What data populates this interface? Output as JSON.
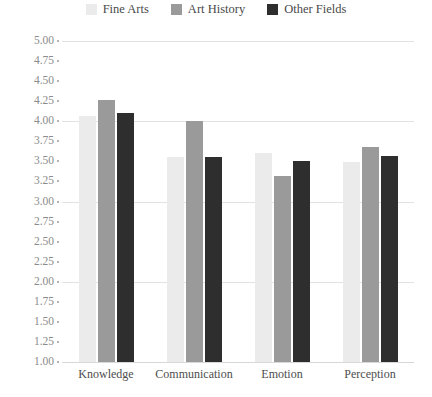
{
  "chart_data": {
    "type": "bar",
    "title": "",
    "subtitle": "",
    "xlabel": "",
    "ylabel": "",
    "categories": [
      "Knowledge",
      "Communication",
      "Emotion",
      "Perception"
    ],
    "series": [
      {
        "name": "Fine Arts",
        "color": "#ebebeb",
        "values": [
          4.07,
          3.56,
          3.6,
          3.49
        ]
      },
      {
        "name": "Art History",
        "color": "#9a9a9a",
        "values": [
          4.27,
          4.0,
          3.32,
          3.68
        ]
      },
      {
        "name": "Other Fields",
        "color": "#2e2e2e",
        "values": [
          4.1,
          3.56,
          3.5,
          3.57
        ]
      }
    ],
    "ylim": [
      1.0,
      5.0
    ],
    "ytick_step": 0.25,
    "ytick_labels": [
      "5.00",
      "4.75",
      "4.50",
      "4.25",
      "4.00",
      "3.75",
      "3.50",
      "3.25",
      "3.00",
      "2.75",
      "2.50",
      "2.25",
      "2.00",
      "1.75",
      "1.50",
      "1.25",
      "1.00"
    ],
    "gridline_values": [
      5.0,
      4.0,
      3.0,
      2.0,
      1.0
    ],
    "grid": true,
    "legend_position": "top-center"
  },
  "colors": {
    "background": "#ffffff",
    "gridline": "#e2e2e2",
    "axis_text": "#8b8b8b",
    "category_text": "#4d4d4d",
    "legend_text": "#4a4a4a",
    "tick_dot": "#b4b4b4"
  }
}
